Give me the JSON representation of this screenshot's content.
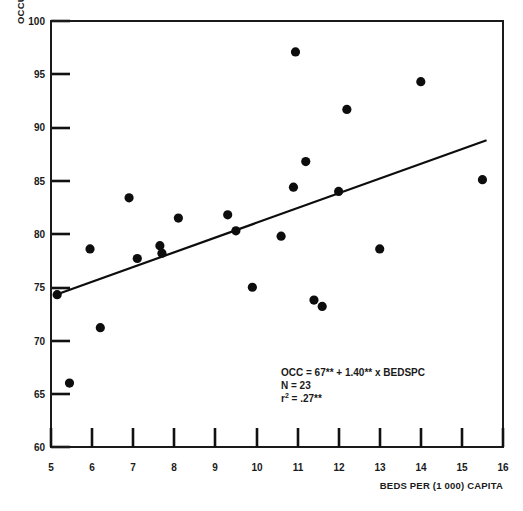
{
  "chart_data": {
    "type": "scatter",
    "title": "",
    "xlabel": "BEDS PER (1 000) CAPITA",
    "ylabel": "OCCUPANCY RATE",
    "xlim": [
      5,
      16
    ],
    "ylim": [
      60,
      100
    ],
    "xticks": [
      5,
      6,
      7,
      8,
      9,
      10,
      11,
      12,
      13,
      14,
      15,
      16
    ],
    "xtick_labels": [
      "5",
      "6",
      "7",
      "8",
      "9",
      "10",
      "11",
      "12",
      "13",
      "14",
      "15",
      "16"
    ],
    "yticks": [
      60,
      65,
      70,
      75,
      80,
      85,
      90,
      95,
      100
    ],
    "ytick_labels": [
      "60",
      "65",
      "70",
      "75",
      "80",
      "85",
      "90",
      "95",
      "100"
    ],
    "grid": false,
    "legend": "none",
    "marker_color": "#0d0d0d",
    "line_color": "#0d0d0d",
    "points": [
      {
        "x": 5.15,
        "y": 74.3
      },
      {
        "x": 5.45,
        "y": 66.0
      },
      {
        "x": 5.95,
        "y": 78.6
      },
      {
        "x": 6.2,
        "y": 71.2
      },
      {
        "x": 6.9,
        "y": 83.4
      },
      {
        "x": 7.1,
        "y": 77.7
      },
      {
        "x": 7.65,
        "y": 78.9
      },
      {
        "x": 7.7,
        "y": 78.2
      },
      {
        "x": 8.1,
        "y": 81.5
      },
      {
        "x": 9.3,
        "y": 81.8
      },
      {
        "x": 9.5,
        "y": 80.3
      },
      {
        "x": 9.9,
        "y": 75.0
      },
      {
        "x": 10.6,
        "y": 79.8
      },
      {
        "x": 10.95,
        "y": 97.1
      },
      {
        "x": 10.9,
        "y": 84.4
      },
      {
        "x": 11.2,
        "y": 86.8
      },
      {
        "x": 11.4,
        "y": 73.8
      },
      {
        "x": 11.6,
        "y": 73.2
      },
      {
        "x": 12.0,
        "y": 84.0
      },
      {
        "x": 12.2,
        "y": 91.7
      },
      {
        "x": 13.0,
        "y": 78.6
      },
      {
        "x": 14.0,
        "y": 94.3
      },
      {
        "x": 15.5,
        "y": 85.1
      }
    ],
    "fit_line": {
      "equation": "OCC = 67** + 1.40** x BEDSPC",
      "intercept": 67,
      "slope": 1.4,
      "x_start": 5.05,
      "x_end": 15.6,
      "y_start": 74.2,
      "y_end": 88.8
    },
    "annotations": {
      "equation": "OCC = 67** + 1.40** x BEDSPC",
      "n_label": "N = 23",
      "r2_prefix": "r",
      "r2_sup": "2",
      "r2_value": " = .27**"
    }
  }
}
